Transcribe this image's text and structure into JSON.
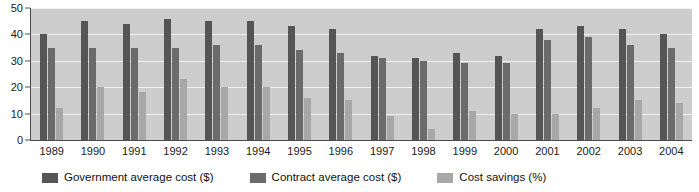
{
  "chart_data": {
    "type": "bar",
    "title": "",
    "xlabel": "",
    "ylabel": "",
    "ylim": [
      0,
      50
    ],
    "yticks": [
      0,
      10,
      20,
      30,
      40,
      50
    ],
    "grid": true,
    "legend_position": "bottom",
    "categories": [
      "1989",
      "1990",
      "1991",
      "1992",
      "1993",
      "1994",
      "1995",
      "1996",
      "1997",
      "1998",
      "1999",
      "2000",
      "2001",
      "2002",
      "2003",
      "2004"
    ],
    "series": [
      {
        "name": "Government average cost ($)",
        "color": "#555555",
        "values": [
          40,
          45,
          44,
          46,
          45,
          45,
          43,
          42,
          32,
          31,
          33,
          32,
          42,
          43,
          42,
          40
        ]
      },
      {
        "name": "Contract average cost ($)",
        "color": "#6b6b6b",
        "values": [
          35,
          35,
          35,
          35,
          36,
          36,
          34,
          33,
          31,
          30,
          29,
          29,
          38,
          39,
          36,
          35
        ]
      },
      {
        "name": "Cost savings (%)",
        "color": "#a8a8a8",
        "values": [
          12,
          20,
          18,
          23,
          20,
          20,
          16,
          15,
          9,
          4,
          11,
          10,
          10,
          12,
          15,
          14
        ]
      }
    ]
  },
  "plot": {
    "background_color": "#cdcdcd",
    "gridline_color": "#f0f0f0",
    "axis_color": "#4a4a4a"
  }
}
